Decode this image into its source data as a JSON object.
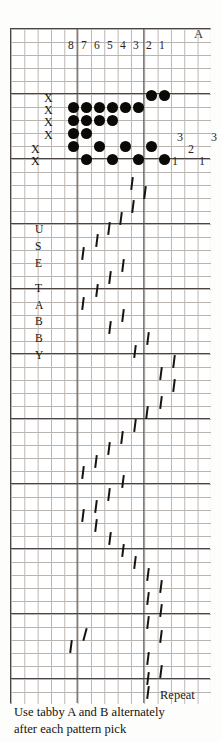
{
  "document": {
    "kind": "weaving-draft",
    "title": "Overshot weaving draft"
  },
  "header": {
    "shaft_numbers": [
      "8",
      "7",
      "6",
      "5",
      "4",
      "3",
      "2",
      "1"
    ],
    "tabby_a_label": "A"
  },
  "left_marks": {
    "label": "X",
    "count": 6,
    "items": [
      "X",
      "X",
      "X",
      "X",
      "X",
      "X"
    ]
  },
  "tabby_column": {
    "letters": [
      "U",
      "S",
      "E",
      "T",
      "A",
      "B",
      "B",
      "Y"
    ],
    "text": "USE TABBY"
  },
  "treadle_numbers": {
    "inner": [
      "3",
      "2",
      "1"
    ],
    "outer": [
      "3",
      "1"
    ]
  },
  "footer": {
    "repeat_label": "Repeat",
    "line1": "Use tabby A and B alternately",
    "line2": "after each pattern pick"
  },
  "colors": {
    "ink": "#0b0906",
    "grid_minor": "#b9b4b0",
    "grid_major": "#4a4542",
    "paper": "#ffffff"
  },
  "threading": {
    "comment": "filled circles, grid column index / row index",
    "rows": [
      {
        "row": 0,
        "cols": [
          7,
          8
        ]
      },
      {
        "row": 1,
        "cols": [
          1,
          2,
          3,
          4,
          5,
          6
        ]
      },
      {
        "row": 2,
        "cols": [
          1,
          2,
          3,
          4
        ]
      },
      {
        "row": 3,
        "cols": [
          1,
          2
        ]
      },
      {
        "row": 4,
        "cols": [
          1,
          3,
          5,
          7
        ]
      },
      {
        "row": 5,
        "cols": [
          2,
          4,
          6,
          8
        ]
      }
    ]
  },
  "treadling": {
    "comment": "tilted tick marks, column index and row index down the draft",
    "marks": [
      {
        "row": 0,
        "col": 5
      },
      {
        "row": 1,
        "col": 6
      },
      {
        "row": 2,
        "col": 5
      },
      {
        "row": 3,
        "col": 4
      },
      {
        "row": 4,
        "col": 4
      },
      {
        "row": 5,
        "col": 3
      },
      {
        "row": 6,
        "col": 2
      },
      {
        "row": 7,
        "col": 2
      },
      {
        "row": 8,
        "col": 5
      },
      {
        "row": 9,
        "col": 4
      },
      {
        "row": 10,
        "col": 3
      },
      {
        "row": 11,
        "col": 2
      },
      {
        "row": 12,
        "col": 5
      },
      {
        "row": 13,
        "col": 4
      },
      {
        "row": 14,
        "col": 6
      },
      {
        "row": 15,
        "col": 5
      },
      {
        "row": 16,
        "col": 7
      },
      {
        "row": 17,
        "col": 6
      },
      {
        "row": 18,
        "col": 7
      },
      {
        "row": 19,
        "col": 6
      },
      {
        "row": 20,
        "col": 6
      },
      {
        "row": 21,
        "col": 5
      },
      {
        "row": 22,
        "col": 5
      },
      {
        "row": 23,
        "col": 4
      },
      {
        "row": 24,
        "col": 4
      },
      {
        "row": 25,
        "col": 3
      },
      {
        "row": 26,
        "col": 2
      },
      {
        "row": 27,
        "col": 4
      },
      {
        "row": 28,
        "col": 3
      },
      {
        "row": 29,
        "col": 2
      },
      {
        "row": 30,
        "col": 2
      },
      {
        "row": 31,
        "col": 3
      },
      {
        "row": 32,
        "col": 4
      },
      {
        "row": 33,
        "col": 5
      },
      {
        "row": 34,
        "col": 6
      },
      {
        "row": 35,
        "col": 7
      },
      {
        "row": 36,
        "col": 6
      },
      {
        "row": 37,
        "col": 7
      },
      {
        "row": 38,
        "col": 6
      },
      {
        "row": 39,
        "col": 3
      },
      {
        "row": 40,
        "col": 2
      },
      {
        "row": 41,
        "col": 7
      },
      {
        "row": 42,
        "col": 6
      },
      {
        "row": 43,
        "col": 7
      },
      {
        "row": 44,
        "col": 6
      },
      {
        "row": 45,
        "col": 6
      }
    ]
  }
}
